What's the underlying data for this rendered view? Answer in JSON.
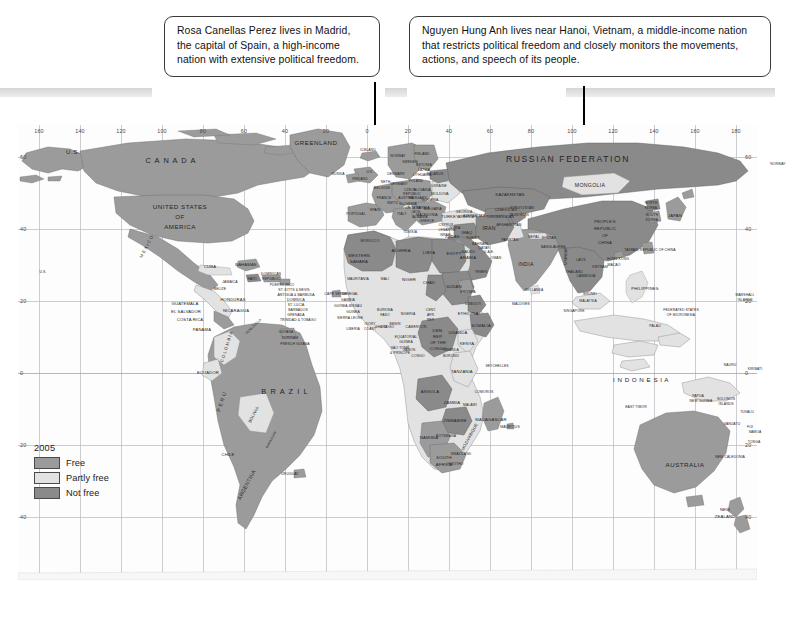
{
  "callouts": [
    {
      "id": "spain",
      "text": "Rosa Canellas Perez lives in Madrid, the capital of Spain, a high-income nation with extensive political freedom."
    },
    {
      "id": "vietnam",
      "text": "Nguyen Hung Anh lives near Hanoi, Vietnam, a middle-income nation that restricts political freedom and closely monitors the movements, actions, and speech of its people."
    }
  ],
  "legend": {
    "year": "2005",
    "items": [
      {
        "label": "Free",
        "color": "#9b9b9b"
      },
      {
        "label": "Partly free",
        "color": "#e2e2e2"
      },
      {
        "label": "Not free",
        "color": "#8a8a8a"
      }
    ]
  },
  "axes": {
    "longitude_labels": [
      "160",
      "140",
      "120",
      "100",
      "80",
      "60",
      "40",
      "20",
      "0",
      "20",
      "40",
      "60",
      "80",
      "100",
      "120",
      "140",
      "160",
      "180"
    ],
    "latitude_labels": [
      "60",
      "40",
      "20",
      "0",
      "20",
      "40"
    ]
  },
  "footer": {
    "note": ""
  },
  "map_labels": [
    {
      "t": "U.S.",
      "x": 55,
      "y": 27,
      "s": "s6"
    },
    {
      "t": "C A N A D A",
      "x": 153,
      "y": 36,
      "s": "s7"
    },
    {
      "t": "GREENLAND",
      "x": 298,
      "y": 18,
      "s": "s6"
    },
    {
      "t": "ICELAND",
      "x": 350,
      "y": 26,
      "s": "s3"
    },
    {
      "t": "UNITED STATES",
      "x": 162,
      "y": 82,
      "s": "s6"
    },
    {
      "t": "OF",
      "x": 162,
      "y": 92,
      "s": "s6"
    },
    {
      "t": "AMERICA",
      "x": 162,
      "y": 102,
      "s": "s6"
    },
    {
      "t": "M E X I C O",
      "x": 129,
      "y": 122,
      "s": "s4",
      "r": "rot-60"
    },
    {
      "t": "U.S.",
      "x": 25,
      "y": 148,
      "s": "s3"
    },
    {
      "t": "CUBA",
      "x": 192,
      "y": 142,
      "s": "s4"
    },
    {
      "t": "BAHAMAS",
      "x": 228,
      "y": 140,
      "s": "s4"
    },
    {
      "t": "BELIZE",
      "x": 202,
      "y": 165,
      "s": "s3"
    },
    {
      "t": "JAMAICA",
      "x": 212,
      "y": 158,
      "s": "s3"
    },
    {
      "t": "HAITI",
      "x": 234,
      "y": 155,
      "s": "s3"
    },
    {
      "t": "DOMINICAN",
      "x": 253,
      "y": 150,
      "s": "s3"
    },
    {
      "t": "REPUBLIC",
      "x": 253,
      "y": 155,
      "s": "s3"
    },
    {
      "t": "PUERTO RICO",
      "x": 264,
      "y": 161,
      "s": "s3"
    },
    {
      "t": "ST. KITTS & NEVIS",
      "x": 276,
      "y": 166,
      "s": "s3"
    },
    {
      "t": "ANTIGUA & BARBUDA",
      "x": 278,
      "y": 171,
      "s": "s3"
    },
    {
      "t": "DOMINICA",
      "x": 278,
      "y": 176,
      "s": "s3"
    },
    {
      "t": "ST. LUCIA",
      "x": 278,
      "y": 181,
      "s": "s3"
    },
    {
      "t": "BARBADOS",
      "x": 280,
      "y": 186,
      "s": "s3"
    },
    {
      "t": "GRENADA",
      "x": 278,
      "y": 191,
      "s": "s3"
    },
    {
      "t": "TRINIDAD & TOBAGO",
      "x": 280,
      "y": 196,
      "s": "s3"
    },
    {
      "t": "GUATEMALA",
      "x": 167,
      "y": 179,
      "s": "s4"
    },
    {
      "t": "HONDURAS",
      "x": 215,
      "y": 175,
      "s": "s4"
    },
    {
      "t": "EL SALVADOR",
      "x": 168,
      "y": 187,
      "s": "s4"
    },
    {
      "t": "NICARAGUA",
      "x": 218,
      "y": 186,
      "s": "s4"
    },
    {
      "t": "COSTA RICA",
      "x": 172,
      "y": 195,
      "s": "s4"
    },
    {
      "t": "PANAMA",
      "x": 184,
      "y": 205,
      "s": "s4"
    },
    {
      "t": "VENEZUELA",
      "x": 236,
      "y": 202,
      "s": "s3",
      "r": "rot-45"
    },
    {
      "t": "C O L O M B I A",
      "x": 209,
      "y": 222,
      "s": "s4",
      "r": "rot-75"
    },
    {
      "t": "GUYANA",
      "x": 268,
      "y": 208,
      "s": "s3"
    },
    {
      "t": "SURINAM",
      "x": 272,
      "y": 214,
      "s": "s3"
    },
    {
      "t": "FRENCH GUIANA",
      "x": 277,
      "y": 220,
      "s": "s3"
    },
    {
      "t": "ECUADOR",
      "x": 190,
      "y": 248,
      "s": "s4"
    },
    {
      "t": "B R A Z I L",
      "x": 267,
      "y": 267,
      "s": "s7"
    },
    {
      "t": "P E R U",
      "x": 204,
      "y": 277,
      "s": "s5",
      "r": "rot-75"
    },
    {
      "t": "BOLIVIA",
      "x": 236,
      "y": 290,
      "s": "s4",
      "r": "rot-60"
    },
    {
      "t": "PARAGUAY",
      "x": 254,
      "y": 315,
      "s": "s3",
      "r": "rot-60"
    },
    {
      "t": "CHILE",
      "x": 210,
      "y": 330,
      "s": "s4"
    },
    {
      "t": "URUGUAY",
      "x": 272,
      "y": 350,
      "s": "s3"
    },
    {
      "t": "ARGENTINA",
      "x": 229,
      "y": 360,
      "s": "s5",
      "r": "rot-60"
    },
    {
      "t": "PORTUGAL",
      "x": 338,
      "y": 90,
      "s": "s3"
    },
    {
      "t": "SPAIN",
      "x": 357,
      "y": 86,
      "s": "s3"
    },
    {
      "t": "IRELAND",
      "x": 342,
      "y": 55,
      "s": "s3"
    },
    {
      "t": "U.K.",
      "x": 352,
      "y": 48,
      "s": "s3"
    },
    {
      "t": "NORWAY",
      "x": 380,
      "y": 32,
      "s": "s3"
    },
    {
      "t": "SWEDEN",
      "x": 392,
      "y": 38,
      "s": "s3"
    },
    {
      "t": "FINLAND",
      "x": 404,
      "y": 30,
      "s": "s3"
    },
    {
      "t": "DENMARK",
      "x": 378,
      "y": 50,
      "s": "s3"
    },
    {
      "t": "NETH.",
      "x": 368,
      "y": 58,
      "s": "s3"
    },
    {
      "t": "BELGIUM",
      "x": 364,
      "y": 64,
      "s": "s3"
    },
    {
      "t": "GERMANY",
      "x": 381,
      "y": 60,
      "s": "s3"
    },
    {
      "t": "POLAND",
      "x": 398,
      "y": 57,
      "s": "s3"
    },
    {
      "t": "ESTONIA",
      "x": 406,
      "y": 41,
      "s": "s3"
    },
    {
      "t": "LATVIA",
      "x": 406,
      "y": 46,
      "s": "s3"
    },
    {
      "t": "LITHUANIA",
      "x": 404,
      "y": 51,
      "s": "s3"
    },
    {
      "t": "BELARUS",
      "x": 417,
      "y": 50,
      "s": "s3"
    },
    {
      "t": "CZECH",
      "x": 392,
      "y": 66,
      "s": "s3"
    },
    {
      "t": "REPUBLIC",
      "x": 394,
      "y": 70,
      "s": "s3"
    },
    {
      "t": "SLOVAKIA",
      "x": 404,
      "y": 66,
      "s": "s3"
    },
    {
      "t": "UKRAINE",
      "x": 421,
      "y": 62,
      "s": "s3"
    },
    {
      "t": "MOLDOVA",
      "x": 422,
      "y": 70,
      "s": "s3"
    },
    {
      "t": "AUSTRIA",
      "x": 388,
      "y": 74,
      "s": "s3"
    },
    {
      "t": "HUNGARY",
      "x": 400,
      "y": 74,
      "s": "s3"
    },
    {
      "t": "ROMANIA",
      "x": 412,
      "y": 76,
      "s": "s3"
    },
    {
      "t": "FRANCE",
      "x": 366,
      "y": 74,
      "s": "s3"
    },
    {
      "t": "SWITZ.",
      "x": 375,
      "y": 79,
      "s": "s3"
    },
    {
      "t": "SLOVENIA",
      "x": 390,
      "y": 80,
      "s": "s3"
    },
    {
      "t": "CROATIA",
      "x": 395,
      "y": 84,
      "s": "s3"
    },
    {
      "t": "BOS.",
      "x": 399,
      "y": 88,
      "s": "s3"
    },
    {
      "t": "SERBIA",
      "x": 405,
      "y": 84,
      "s": "s3"
    },
    {
      "t": "BULGARIA",
      "x": 415,
      "y": 85,
      "s": "s3"
    },
    {
      "t": "ITALY",
      "x": 384,
      "y": 90,
      "s": "s3"
    },
    {
      "t": "ALBANIA",
      "x": 402,
      "y": 93,
      "s": "s3"
    },
    {
      "t": "MACEDONIA",
      "x": 409,
      "y": 91,
      "s": "s3"
    },
    {
      "t": "GREECE",
      "x": 409,
      "y": 97,
      "s": "s3"
    },
    {
      "t": "TURKEY",
      "x": 432,
      "y": 92,
      "s": "s4"
    },
    {
      "t": "CYPRUS",
      "x": 428,
      "y": 101,
      "s": "s3"
    },
    {
      "t": "SYRIA",
      "x": 437,
      "y": 104,
      "s": "s3"
    },
    {
      "t": "LEBANON",
      "x": 429,
      "y": 106,
      "s": "s3"
    },
    {
      "t": "ISRAEL",
      "x": 428,
      "y": 111,
      "s": "s3"
    },
    {
      "t": "JORDAN",
      "x": 434,
      "y": 113,
      "s": "s3"
    },
    {
      "t": "IRAQ",
      "x": 449,
      "y": 108,
      "s": "s4"
    },
    {
      "t": "IRAN",
      "x": 471,
      "y": 104,
      "s": "s5"
    },
    {
      "t": "GEORGIA",
      "x": 446,
      "y": 88,
      "s": "s3"
    },
    {
      "t": "ARMENIA",
      "x": 448,
      "y": 93,
      "s": "s3"
    },
    {
      "t": "AZERBAIJAN",
      "x": 456,
      "y": 92,
      "s": "s3"
    },
    {
      "t": "KUWAIT",
      "x": 455,
      "y": 114,
      "s": "s3"
    },
    {
      "t": "SAUDI",
      "x": 450,
      "y": 127,
      "s": "s4"
    },
    {
      "t": "ARABIA",
      "x": 450,
      "y": 133,
      "s": "s4"
    },
    {
      "t": "QATAR",
      "x": 466,
      "y": 124,
      "s": "s3"
    },
    {
      "t": "BAHRAIN",
      "x": 462,
      "y": 120,
      "s": "s3"
    },
    {
      "t": "U.A.E.",
      "x": 471,
      "y": 128,
      "s": "s3"
    },
    {
      "t": "OMAN",
      "x": 478,
      "y": 134,
      "s": "s3"
    },
    {
      "t": "YEMEN",
      "x": 463,
      "y": 148,
      "s": "s3"
    },
    {
      "t": "RUSSIAN   FEDERATION",
      "x": 550,
      "y": 35,
      "s": "s8"
    },
    {
      "t": "KAZAKHSTAN",
      "x": 492,
      "y": 70,
      "s": "s4"
    },
    {
      "t": "UZBEKISTAN",
      "x": 488,
      "y": 86,
      "s": "s3"
    },
    {
      "t": "TURKMENISTAN",
      "x": 482,
      "y": 93,
      "s": "s3"
    },
    {
      "t": "KYRGYZSTAN",
      "x": 504,
      "y": 84,
      "s": "s3"
    },
    {
      "t": "TAJIKISTAN",
      "x": 501,
      "y": 91,
      "s": "s3"
    },
    {
      "t": "AFGHANISTAN",
      "x": 491,
      "y": 101,
      "s": "s3"
    },
    {
      "t": "PAKISTAN",
      "x": 492,
      "y": 116,
      "s": "s3"
    },
    {
      "t": "MONGOLIA",
      "x": 572,
      "y": 61,
      "s": "s5"
    },
    {
      "t": "PEOPLE'S",
      "x": 587,
      "y": 97,
      "s": "s4"
    },
    {
      "t": "REPUBLIC",
      "x": 587,
      "y": 104,
      "s": "s4"
    },
    {
      "t": "OF",
      "x": 587,
      "y": 111,
      "s": "s4"
    },
    {
      "t": "CHINA",
      "x": 587,
      "y": 118,
      "s": "s4"
    },
    {
      "t": "NORTH",
      "x": 633,
      "y": 79,
      "s": "s3"
    },
    {
      "t": "KOREA",
      "x": 633,
      "y": 84,
      "s": "s3"
    },
    {
      "t": "SOUTH",
      "x": 634,
      "y": 91,
      "s": "s3"
    },
    {
      "t": "KOREA",
      "x": 634,
      "y": 96,
      "s": "s3"
    },
    {
      "t": "JAPAN",
      "x": 657,
      "y": 91,
      "s": "s4"
    },
    {
      "t": "NEPAL",
      "x": 516,
      "y": 113,
      "s": "s3"
    },
    {
      "t": "BHUTAN",
      "x": 531,
      "y": 114,
      "s": "s3"
    },
    {
      "t": "INDIA",
      "x": 508,
      "y": 140,
      "s": "s5"
    },
    {
      "t": "BANGLADESH",
      "x": 535,
      "y": 123,
      "s": "s3"
    },
    {
      "t": "MYANMAR",
      "x": 549,
      "y": 131,
      "s": "s3",
      "r": "rot-90"
    },
    {
      "t": "SRI LANKA",
      "x": 516,
      "y": 166,
      "s": "s3"
    },
    {
      "t": "THAILAND",
      "x": 556,
      "y": 148,
      "s": "s3"
    },
    {
      "t": "LAOS",
      "x": 563,
      "y": 136,
      "s": "s3"
    },
    {
      "t": "VIETNAM",
      "x": 582,
      "y": 143,
      "s": "s3"
    },
    {
      "t": "CAMBODIA",
      "x": 568,
      "y": 152,
      "s": "s3"
    },
    {
      "t": "HONG KONG",
      "x": 600,
      "y": 135,
      "s": "s3"
    },
    {
      "t": "MACAO",
      "x": 596,
      "y": 141,
      "s": "s3"
    },
    {
      "t": "TAIWAN, REPUBLIC OF CHINA",
      "x": 632,
      "y": 126,
      "s": "s3"
    },
    {
      "t": "PHILIPPINES",
      "x": 627,
      "y": 164,
      "s": "s4"
    },
    {
      "t": "MALAYSIA",
      "x": 570,
      "y": 177,
      "s": "s3"
    },
    {
      "t": "BRUNEI",
      "x": 572,
      "y": 170,
      "s": "s3"
    },
    {
      "t": "SINGAPORE",
      "x": 556,
      "y": 187,
      "s": "s3"
    },
    {
      "t": "I N D O N E S I A",
      "x": 623,
      "y": 255,
      "s": "s6"
    },
    {
      "t": "EAST TIMOR",
      "x": 618,
      "y": 283,
      "s": "s3"
    },
    {
      "t": "PAPUA",
      "x": 680,
      "y": 272,
      "s": "s3"
    },
    {
      "t": "NEW GUINEA",
      "x": 683,
      "y": 277,
      "s": "s3"
    },
    {
      "t": "AUSTRALIA",
      "x": 667,
      "y": 340,
      "s": "s6"
    },
    {
      "t": "NEW",
      "x": 707,
      "y": 385,
      "s": "s4"
    },
    {
      "t": "ZEALAND",
      "x": 707,
      "y": 392,
      "s": "s4"
    },
    {
      "t": "FEDERATED STATES",
      "x": 663,
      "y": 186,
      "s": "s3"
    },
    {
      "t": "OF MICRONESIA",
      "x": 663,
      "y": 191,
      "s": "s3"
    },
    {
      "t": "PALAU",
      "x": 637,
      "y": 202,
      "s": "s3"
    },
    {
      "t": "MARSHALL",
      "x": 727,
      "y": 171,
      "s": "s3"
    },
    {
      "t": "ISLANDS",
      "x": 727,
      "y": 176,
      "s": "s3"
    },
    {
      "t": "NAURU",
      "x": 712,
      "y": 241,
      "s": "s3"
    },
    {
      "t": "KIRIBATI",
      "x": 737,
      "y": 245,
      "s": "s3"
    },
    {
      "t": "SOLOMON",
      "x": 708,
      "y": 275,
      "s": "s3"
    },
    {
      "t": "ISLANDS",
      "x": 708,
      "y": 280,
      "s": "s3"
    },
    {
      "t": "TUVALU",
      "x": 729,
      "y": 288,
      "s": "s3"
    },
    {
      "t": "VANUATU",
      "x": 714,
      "y": 300,
      "s": "s3"
    },
    {
      "t": "FIJI",
      "x": 732,
      "y": 303,
      "s": "s3"
    },
    {
      "t": "SAMOA",
      "x": 737,
      "y": 308,
      "s": "s3"
    },
    {
      "t": "NEW CALEDONIA",
      "x": 712,
      "y": 333,
      "s": "s3"
    },
    {
      "t": "TONGA",
      "x": 736,
      "y": 318,
      "s": "s3"
    },
    {
      "t": "WESTERN",
      "x": 341,
      "y": 131,
      "s": "s4"
    },
    {
      "t": "SAHARA",
      "x": 341,
      "y": 137,
      "s": "s4"
    },
    {
      "t": "MOROCCO",
      "x": 352,
      "y": 117,
      "s": "s3"
    },
    {
      "t": "ALGERIA",
      "x": 383,
      "y": 126,
      "s": "s4"
    },
    {
      "t": "TUNISIA",
      "x": 392,
      "y": 108,
      "s": "s3"
    },
    {
      "t": "LIBYA",
      "x": 411,
      "y": 128,
      "s": "s4"
    },
    {
      "t": "EGYPT",
      "x": 436,
      "y": 129,
      "s": "s4"
    },
    {
      "t": "MAURITANIA",
      "x": 340,
      "y": 155,
      "s": "s3"
    },
    {
      "t": "MALI",
      "x": 367,
      "y": 155,
      "s": "s3"
    },
    {
      "t": "NIGER",
      "x": 391,
      "y": 155,
      "s": "s4"
    },
    {
      "t": "CHAD",
      "x": 411,
      "y": 158,
      "s": "s4"
    },
    {
      "t": "SUDAN",
      "x": 436,
      "y": 162,
      "s": "s4"
    },
    {
      "t": "ERITREA",
      "x": 450,
      "y": 168,
      "s": "s3"
    },
    {
      "t": "DJIBOUTI",
      "x": 455,
      "y": 180,
      "s": "s3"
    },
    {
      "t": "SENEGAL",
      "x": 332,
      "y": 170,
      "s": "s3"
    },
    {
      "t": "GAMBIA",
      "x": 330,
      "y": 176,
      "s": "s3"
    },
    {
      "t": "CAPE VERDE",
      "x": 318,
      "y": 170,
      "s": "s3"
    },
    {
      "t": "GUINEA-BISSAU",
      "x": 330,
      "y": 182,
      "s": "s3"
    },
    {
      "t": "GUINEA",
      "x": 335,
      "y": 188,
      "s": "s3"
    },
    {
      "t": "SIERRA LEONE",
      "x": 332,
      "y": 194,
      "s": "s3"
    },
    {
      "t": "LIBERIA",
      "x": 335,
      "y": 205,
      "s": "s3"
    },
    {
      "t": "IVORY",
      "x": 352,
      "y": 200,
      "s": "s3"
    },
    {
      "t": "COAST",
      "x": 352,
      "y": 205,
      "s": "s3"
    },
    {
      "t": "BURKINA",
      "x": 367,
      "y": 186,
      "s": "s3"
    },
    {
      "t": "FASO",
      "x": 367,
      "y": 191,
      "s": "s3"
    },
    {
      "t": "GHANA",
      "x": 363,
      "y": 203,
      "s": "s3"
    },
    {
      "t": "TOGO",
      "x": 371,
      "y": 203,
      "s": "s3"
    },
    {
      "t": "BENIN",
      "x": 377,
      "y": 200,
      "s": "s3"
    },
    {
      "t": "NIGERIA",
      "x": 390,
      "y": 190,
      "s": "s3"
    },
    {
      "t": "CAMEROON",
      "x": 398,
      "y": 203,
      "s": "s3"
    },
    {
      "t": "CENT.",
      "x": 413,
      "y": 186,
      "s": "s3"
    },
    {
      "t": "AFR.",
      "x": 413,
      "y": 191,
      "s": "s3"
    },
    {
      "t": "REP.",
      "x": 413,
      "y": 196,
      "s": "s3"
    },
    {
      "t": "EQUATORIAL",
      "x": 388,
      "y": 213,
      "s": "s3"
    },
    {
      "t": "GUINEA",
      "x": 388,
      "y": 218,
      "s": "s3"
    },
    {
      "t": "GABON",
      "x": 391,
      "y": 226,
      "s": "s3"
    },
    {
      "t": "CONGO",
      "x": 400,
      "y": 232,
      "s": "s3"
    },
    {
      "t": "SÃO TOMÉ",
      "x": 382,
      "y": 224,
      "s": "s3"
    },
    {
      "t": "& PRÍNCIPE",
      "x": 382,
      "y": 229,
      "s": "s3"
    },
    {
      "t": "DEM.",
      "x": 420,
      "y": 206,
      "s": "s4"
    },
    {
      "t": "REP.",
      "x": 420,
      "y": 212,
      "s": "s4"
    },
    {
      "t": "OF THE",
      "x": 420,
      "y": 218,
      "s": "s4"
    },
    {
      "t": "CONGO",
      "x": 420,
      "y": 224,
      "s": "s4"
    },
    {
      "t": "UGANDA",
      "x": 440,
      "y": 208,
      "s": "s4"
    },
    {
      "t": "KENYA",
      "x": 449,
      "y": 219,
      "s": "s4"
    },
    {
      "t": "RWANDA",
      "x": 433,
      "y": 226,
      "s": "s3"
    },
    {
      "t": "BURUNDI",
      "x": 433,
      "y": 232,
      "s": "s3"
    },
    {
      "t": "SOMALIA",
      "x": 463,
      "y": 201,
      "s": "s4"
    },
    {
      "t": "ETHIOPIA",
      "x": 450,
      "y": 189,
      "s": "s4"
    },
    {
      "t": "TANZANIA",
      "x": 444,
      "y": 247,
      "s": "s4"
    },
    {
      "t": "MALDIVES",
      "x": 503,
      "y": 180,
      "s": "s3"
    },
    {
      "t": "SEYCHELLES",
      "x": 479,
      "y": 242,
      "s": "s3"
    },
    {
      "t": "ANGOLA",
      "x": 412,
      "y": 267,
      "s": "s4"
    },
    {
      "t": "ZAMBIA",
      "x": 434,
      "y": 278,
      "s": "s4"
    },
    {
      "t": "MALAWI",
      "x": 452,
      "y": 281,
      "s": "s3"
    },
    {
      "t": "COMOROS",
      "x": 466,
      "y": 268,
      "s": "s3"
    },
    {
      "t": "MOZAMBIQUE",
      "x": 452,
      "y": 312,
      "s": "s4",
      "r": "rot-60"
    },
    {
      "t": "ZIMBABWE",
      "x": 437,
      "y": 296,
      "s": "s4"
    },
    {
      "t": "BOTSWANA",
      "x": 428,
      "y": 312,
      "s": "s3"
    },
    {
      "t": "NAMIBIA",
      "x": 411,
      "y": 313,
      "s": "s4"
    },
    {
      "t": "MADAGASCAR",
      "x": 473,
      "y": 295,
      "s": "s4"
    },
    {
      "t": "MAURITIUS",
      "x": 492,
      "y": 303,
      "s": "s3"
    },
    {
      "t": "SWAZILAND",
      "x": 443,
      "y": 330,
      "s": "s3"
    },
    {
      "t": "LESOTHO",
      "x": 437,
      "y": 340,
      "s": "s3"
    },
    {
      "t": "SOUTH",
      "x": 426,
      "y": 333,
      "s": "s4"
    },
    {
      "t": "AFRICA",
      "x": 426,
      "y": 340,
      "s": "s4"
    },
    {
      "t": "RUSSIA",
      "x": 320,
      "y": 50,
      "s": "s3"
    },
    {
      "t": "NORWAY",
      "x": 760,
      "y": 40,
      "s": "s3"
    }
  ]
}
